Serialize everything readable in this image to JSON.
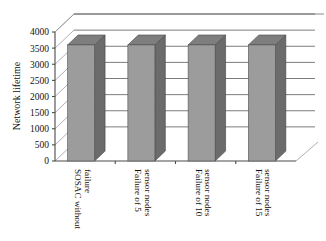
{
  "chart_data": {
    "type": "bar",
    "title": "",
    "subtitle": "",
    "xlabel": "",
    "ylabel": "Network lifetime",
    "ylim": [
      0,
      4000
    ],
    "ytick_step": 500,
    "yticks": [
      "0",
      "500",
      "1000",
      "1500",
      "2000",
      "2500",
      "3000",
      "3500",
      "4000"
    ],
    "grid": true,
    "legend": "none",
    "three_d": true,
    "categories": [
      "SOSAC without failure",
      "Failure of 5 sensor nodes",
      "Failure of 10 sensor nodes",
      "Failure of 15 sensor nodes"
    ],
    "category_lines": [
      [
        "SOSAC without",
        "failure"
      ],
      [
        "Failure of 5",
        "sensor nodes"
      ],
      [
        "Failure of 10",
        "sensor nodes"
      ],
      [
        "Failure of 15",
        "sensor nodes"
      ]
    ],
    "values": [
      3600,
      3600,
      3600,
      3600
    ],
    "colors": {
      "bar_front": "#9c9c9c",
      "bar_side": "#6b6b6b",
      "bar_top": "#7e7e7e",
      "axis": "#4a4a4a",
      "grid": "#5a5a5a",
      "background": "#ffffff"
    }
  },
  "axis": {
    "y_title": "Network lifetime"
  }
}
